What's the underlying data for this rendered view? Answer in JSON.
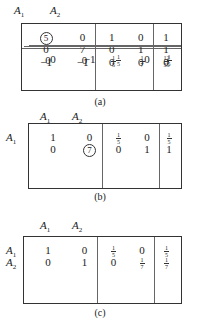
{
  "tableaux": [
    {
      "caption": "(a)",
      "col_headers": [
        "A1",
        "A2"
      ],
      "row_labels": [],
      "rows": [
        [
          "5",
          "0",
          "1",
          "0",
          "1"
        ],
        [
          "0",
          "7",
          "0",
          "1",
          "1"
        ]
      ],
      "objective": [
        "−1",
        "−1",
        "0",
        "0",
        "0"
      ],
      "pivot": {
        "row": 0,
        "col": 0
      }
    },
    {
      "caption": "(b)",
      "col_headers": [
        "A1",
        "A2"
      ],
      "row_labels": [
        "A1",
        ""
      ],
      "rows": [
        [
          "1",
          "0",
          "1/5",
          "0",
          "1/5"
        ],
        [
          "0",
          "7",
          "0",
          "1",
          "1"
        ]
      ],
      "objective": [
        "0",
        "−1",
        "1/5",
        "0",
        "1/5"
      ],
      "pivot": {
        "row": 1,
        "col": 1
      }
    },
    {
      "caption": "(c)",
      "col_headers": [
        "A1",
        "A2"
      ],
      "row_labels": [
        "A1",
        "A2"
      ],
      "rows": [
        [
          "1",
          "0",
          "1/5",
          "0",
          "1/5"
        ],
        [
          "0",
          "1",
          "0",
          "1/7",
          "1/7"
        ]
      ],
      "objective": [
        "0",
        "0",
        "1/5",
        "1/7",
        "12/35"
      ]
    }
  ]
}
